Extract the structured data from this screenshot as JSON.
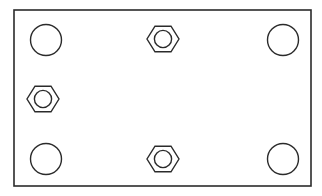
{
  "drawing": {
    "title": "Rectangular plate with corner holes and hex nuts",
    "canvas": {
      "width": 322,
      "height": 196,
      "background": "#ffffff"
    },
    "stroke_color": "#2b2b2b",
    "fill_color": "none",
    "plate": {
      "name": "rectangular-plate",
      "x": 14,
      "y": 10,
      "width": 297,
      "height": 176,
      "stroke_width": 1.6
    },
    "circles": [
      {
        "name": "hole-top-left",
        "cx": 46,
        "cy": 40,
        "r": 15.5,
        "stroke_width": 1.4
      },
      {
        "name": "hole-top-right",
        "cx": 283,
        "cy": 40,
        "r": 15.5,
        "stroke_width": 1.4
      },
      {
        "name": "hole-bottom-left",
        "cx": 46,
        "cy": 159,
        "r": 15.5,
        "stroke_width": 1.4
      },
      {
        "name": "hole-bottom-right",
        "cx": 283,
        "cy": 159,
        "r": 15.5,
        "stroke_width": 1.4
      }
    ],
    "hex_nuts": [
      {
        "name": "hex-nut-top-center",
        "cx": 163,
        "cy": 39,
        "outer_r": 16,
        "inner_r": 8.6,
        "stroke_width": 1.4
      },
      {
        "name": "hex-nut-middle-left",
        "cx": 43,
        "cy": 99,
        "outer_r": 16,
        "inner_r": 8.6,
        "stroke_width": 1.4
      },
      {
        "name": "hex-nut-bottom-center",
        "cx": 163,
        "cy": 159,
        "outer_r": 16,
        "inner_r": 8.6,
        "stroke_width": 1.4
      }
    ]
  }
}
